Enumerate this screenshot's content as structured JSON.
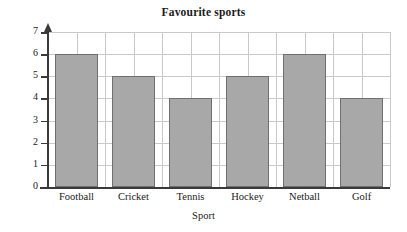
{
  "chart_data": {
    "type": "bar",
    "title": "Favourite sports",
    "xlabel": "Sport",
    "ylabel": "Frequency",
    "categories": [
      "Football",
      "Cricket",
      "Tennis",
      "Hockey",
      "Netball",
      "Golf"
    ],
    "values": [
      6,
      5,
      4,
      5,
      6,
      4
    ],
    "ylim": [
      0,
      7
    ],
    "ytick_labels": [
      "0",
      "1",
      "2",
      "3",
      "4",
      "5",
      "6",
      "7"
    ],
    "ytick_values": [
      0,
      1,
      2,
      3,
      4,
      5,
      6,
      7
    ],
    "grid": true,
    "legend": "none",
    "colors": {
      "bar_fill": "#a8a8a8",
      "bar_edge": "#6f6f6f",
      "grid": "#c9c9c9",
      "axis": "#3a3a3a",
      "background": "#ffffff",
      "text": "#1a1a1a"
    }
  }
}
